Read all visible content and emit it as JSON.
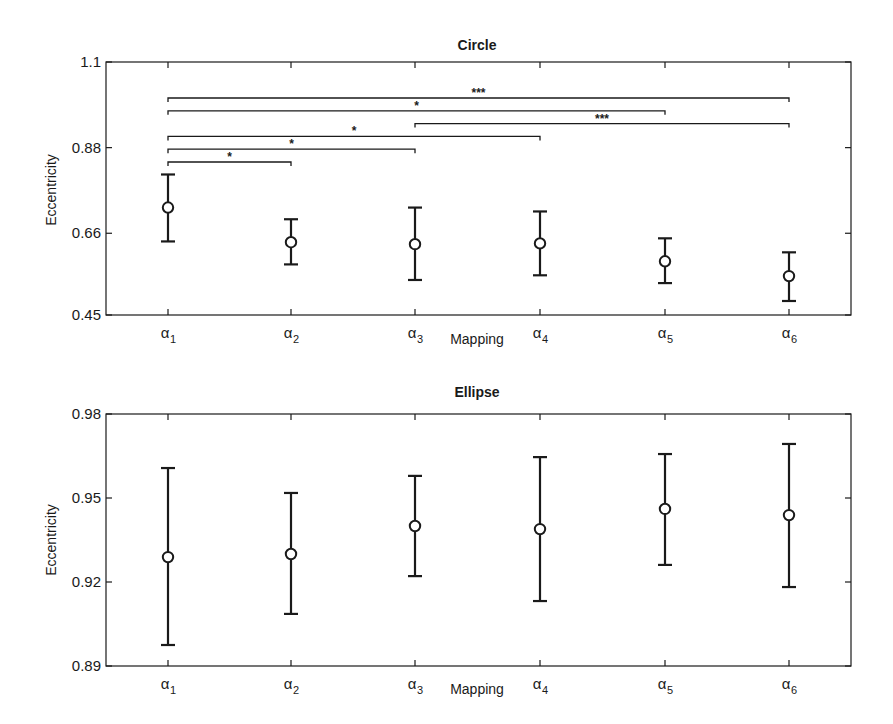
{
  "chart_data": [
    {
      "type": "errorbar",
      "title": "Circle",
      "xlabel": "Mapping",
      "ylabel": "Eccentricity",
      "categories": [
        "α1",
        "α2",
        "α3",
        "α4",
        "α5",
        "α6"
      ],
      "category_main": "α",
      "category_subs": [
        "1",
        "2",
        "3",
        "4",
        "5",
        "6"
      ],
      "ylim": [
        0.45,
        1.1
      ],
      "yticks": [
        0.45,
        0.66,
        0.88,
        1.1
      ],
      "ytick_labels": [
        "0.45",
        "0.66",
        "0.88",
        "1.1"
      ],
      "grid": false,
      "legend": null,
      "series": [
        {
          "name": "Circle eccentricity",
          "marker": "open-circle",
          "mean": [
            0.726,
            0.637,
            0.632,
            0.634,
            0.588,
            0.55
          ],
          "upper": [
            0.811,
            0.696,
            0.726,
            0.716,
            0.647,
            0.611
          ],
          "lower": [
            0.639,
            0.58,
            0.54,
            0.552,
            0.532,
            0.486
          ]
        }
      ],
      "significance": [
        {
          "from": 0,
          "to": 5,
          "label": "***",
          "level": 1
        },
        {
          "from": 0,
          "to": 4,
          "label": "*",
          "level": 2
        },
        {
          "from": 2,
          "to": 5,
          "label": "***",
          "level": 3
        },
        {
          "from": 0,
          "to": 3,
          "label": "*",
          "level": 4
        },
        {
          "from": 0,
          "to": 2,
          "label": "*",
          "level": 5
        },
        {
          "from": 0,
          "to": 1,
          "label": "*",
          "level": 6
        }
      ]
    },
    {
      "type": "errorbar",
      "title": "Ellipse",
      "xlabel": "Mapping",
      "ylabel": "Eccentricity",
      "categories": [
        "α1",
        "α2",
        "α3",
        "α4",
        "α5",
        "α6"
      ],
      "category_main": "α",
      "category_subs": [
        "1",
        "2",
        "3",
        "4",
        "5",
        "6"
      ],
      "ylim": [
        0.89,
        0.98
      ],
      "yticks": [
        0.89,
        0.92,
        0.95,
        0.98
      ],
      "ytick_labels": [
        "0.89",
        "0.92",
        "0.95",
        "0.98"
      ],
      "grid": false,
      "legend": null,
      "series": [
        {
          "name": "Ellipse eccentricity",
          "marker": "open-circle",
          "mean": [
            0.9289,
            0.93,
            0.94,
            0.9389,
            0.9461,
            0.9439
          ],
          "upper": [
            0.9607,
            0.9518,
            0.9579,
            0.9646,
            0.9657,
            0.9693
          ],
          "lower": [
            0.8975,
            0.9086,
            0.9221,
            0.9132,
            0.9261,
            0.9182
          ]
        }
      ],
      "significance": []
    }
  ],
  "style": {
    "ink": "#1a1a1a",
    "background": "#ffffff"
  }
}
